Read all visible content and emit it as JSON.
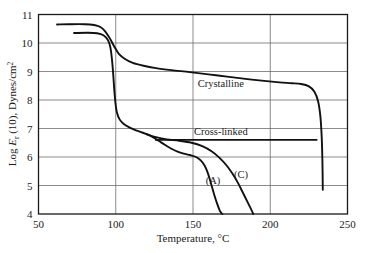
{
  "chart_data": {
    "type": "line",
    "title": "",
    "xlabel": "Temperature, °C",
    "ylabel": "Log E_r (10), Dynes/cm^2",
    "xlim": [
      50,
      250
    ],
    "ylim": [
      4,
      11
    ],
    "xticks": [
      50,
      100,
      150,
      200,
      250
    ],
    "yticks": [
      4,
      5,
      6,
      7,
      8,
      9,
      10,
      11
    ],
    "grid": true,
    "legend_position": "inline-annotations",
    "annotations": [
      {
        "text": "Crystalline",
        "x": 168,
        "y": 8.45
      },
      {
        "text": "Cross-linked",
        "x": 168,
        "y": 6.78
      },
      {
        "text": "(A)",
        "x": 163,
        "y": 5.05
      },
      {
        "text": "(C)",
        "x": 181,
        "y": 5.25
      }
    ],
    "series": [
      {
        "name": "Crystalline",
        "label": "Crystalline",
        "points": [
          [
            62.0,
            10.65
          ],
          [
            70.0,
            10.66
          ],
          [
            80.0,
            10.66
          ],
          [
            86.0,
            10.63
          ],
          [
            90.0,
            10.56
          ],
          [
            93.0,
            10.42
          ],
          [
            96.0,
            10.18
          ],
          [
            99.0,
            9.88
          ],
          [
            102.0,
            9.62
          ],
          [
            106.0,
            9.44
          ],
          [
            111.0,
            9.3
          ],
          [
            118.0,
            9.2
          ],
          [
            126.0,
            9.12
          ],
          [
            136.0,
            9.05
          ],
          [
            148.0,
            8.98
          ],
          [
            160.0,
            8.9
          ],
          [
            172.0,
            8.82
          ],
          [
            184.0,
            8.74
          ],
          [
            196.0,
            8.67
          ],
          [
            206.0,
            8.62
          ],
          [
            214.0,
            8.59
          ],
          [
            220.0,
            8.56
          ],
          [
            225.0,
            8.48
          ],
          [
            228.5,
            8.3
          ],
          [
            231.0,
            7.95
          ],
          [
            232.5,
            7.4
          ],
          [
            233.3,
            6.7
          ],
          [
            233.7,
            6.0
          ],
          [
            233.9,
            5.4
          ],
          [
            234.0,
            4.85
          ]
        ]
      },
      {
        "name": "Amorphous-trunk",
        "label": "",
        "points": [
          [
            73.0,
            10.35
          ],
          [
            82.0,
            10.36
          ],
          [
            88.0,
            10.34
          ],
          [
            92.0,
            10.27
          ],
          [
            95.0,
            10.1
          ],
          [
            96.5,
            9.85
          ],
          [
            97.5,
            9.45
          ],
          [
            98.3,
            8.95
          ],
          [
            99.0,
            8.4
          ],
          [
            99.8,
            7.9
          ],
          [
            100.8,
            7.55
          ],
          [
            102.5,
            7.32
          ],
          [
            105.0,
            7.17
          ],
          [
            108.5,
            7.05
          ],
          [
            112.0,
            6.96
          ],
          [
            116.0,
            6.88
          ],
          [
            120.0,
            6.8
          ]
        ]
      },
      {
        "name": "Linear amorphous (A)",
        "label": "(A)",
        "points": [
          [
            120.0,
            6.8
          ],
          [
            124.0,
            6.7
          ],
          [
            128.0,
            6.56
          ],
          [
            132.0,
            6.42
          ],
          [
            136.0,
            6.29
          ],
          [
            140.0,
            6.19
          ],
          [
            144.0,
            6.12
          ],
          [
            148.0,
            6.07
          ],
          [
            152.0,
            6.0
          ],
          [
            155.0,
            5.88
          ],
          [
            157.5,
            5.7
          ],
          [
            159.5,
            5.45
          ],
          [
            161.5,
            5.1
          ],
          [
            163.5,
            4.72
          ],
          [
            165.5,
            4.38
          ],
          [
            167.5,
            4.1
          ],
          [
            169.0,
            4.0
          ]
        ]
      },
      {
        "name": "Crystalline-low (C)",
        "label": "(C)",
        "points": [
          [
            120.0,
            6.8
          ],
          [
            126.0,
            6.7
          ],
          [
            133.0,
            6.62
          ],
          [
            141.0,
            6.57
          ],
          [
            149.0,
            6.5
          ],
          [
            156.0,
            6.38
          ],
          [
            162.0,
            6.2
          ],
          [
            167.0,
            5.98
          ],
          [
            171.5,
            5.72
          ],
          [
            175.5,
            5.42
          ],
          [
            179.0,
            5.1
          ],
          [
            182.0,
            4.78
          ],
          [
            185.0,
            4.45
          ],
          [
            187.5,
            4.18
          ],
          [
            189.0,
            4.0
          ]
        ]
      },
      {
        "name": "Cross-linked",
        "label": "Cross-linked",
        "points": [
          [
            126.0,
            6.6
          ],
          [
            150.0,
            6.6
          ],
          [
            180.0,
            6.6
          ],
          [
            210.0,
            6.6
          ],
          [
            230.0,
            6.6
          ]
        ]
      }
    ]
  },
  "axes": {
    "y_title_parts": {
      "lead": "Log ",
      "italic": "E",
      "subscript": "r",
      "mid": " (10), Dynes/cm",
      "superscript": "2"
    },
    "x_title": "Temperature, °C"
  }
}
